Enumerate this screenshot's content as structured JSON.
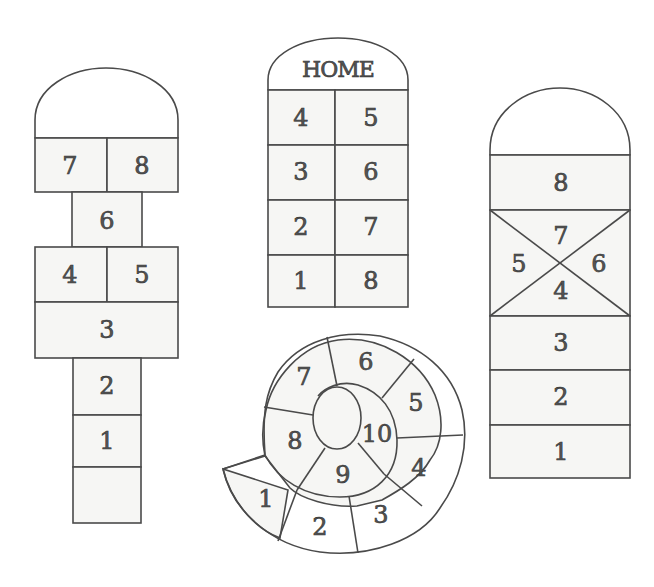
{
  "colors": {
    "line": "#4a4a4a",
    "ink": "#555555",
    "paper": "#ffffff",
    "shade": "#f6f6f4"
  },
  "courts": {
    "classic": {
      "name": "Classic hopscotch",
      "cells": [
        "7",
        "8",
        "6",
        "4",
        "5",
        "3",
        "2",
        "1",
        ""
      ]
    },
    "home": {
      "name": "Home hopscotch",
      "home_label": "HOME",
      "cells": [
        "4",
        "5",
        "3",
        "6",
        "2",
        "7",
        "1",
        "8"
      ]
    },
    "spiral": {
      "name": "Snail spiral hopscotch",
      "cells": [
        "1",
        "2",
        "3",
        "4",
        "5",
        "6",
        "7",
        "8",
        "9",
        "10"
      ]
    },
    "cross": {
      "name": "Cross hopscotch",
      "cells": [
        "8",
        "7",
        "5",
        "6",
        "4",
        "3",
        "2",
        "1"
      ]
    }
  }
}
